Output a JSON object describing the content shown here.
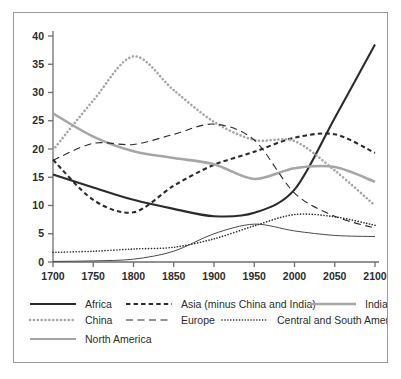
{
  "chart_data": {
    "type": "line",
    "title": "",
    "subtitle": "",
    "xlabel": "",
    "ylabel": "",
    "xlim": [
      1700,
      2100
    ],
    "ylim": [
      0,
      40
    ],
    "xticks": [
      1700,
      1750,
      1800,
      1850,
      1900,
      1950,
      2000,
      2050,
      2100
    ],
    "yticks": [
      0,
      5,
      10,
      15,
      20,
      25,
      30,
      35,
      40
    ],
    "grid": false,
    "legend_position": "bottom",
    "x": [
      1700,
      1750,
      1800,
      1850,
      1900,
      1950,
      2000,
      2050,
      2100
    ],
    "series": [
      {
        "name": "Africa",
        "style": "solid",
        "color": "#2b2b2b",
        "width": 2.1,
        "values": [
          15.5,
          13.2,
          11.0,
          9.4,
          8.1,
          8.7,
          12.8,
          25.5,
          38.5
        ]
      },
      {
        "name": "Asia (minus China and India)",
        "style": "dashed-thick",
        "color": "#2b2b2b",
        "width": 2.1,
        "values": [
          18.1,
          11.0,
          8.8,
          13.5,
          17.2,
          19.5,
          22.0,
          22.6,
          19.3
        ]
      },
      {
        "name": "India",
        "style": "solid",
        "color": "#a6a6a6",
        "width": 2.6,
        "values": [
          26.3,
          22.2,
          19.6,
          18.4,
          17.3,
          14.7,
          16.6,
          16.8,
          14.2
        ]
      },
      {
        "name": "China",
        "style": "dotted-thick",
        "color": "#a6a6a6",
        "width": 2.6,
        "values": [
          19.8,
          28.6,
          36.4,
          30.4,
          24.8,
          21.6,
          21.4,
          16.2,
          10.0
        ]
      },
      {
        "name": "Europe",
        "style": "dashed-thin",
        "color": "#2b2b2b",
        "width": 1.1,
        "values": [
          18.0,
          21.0,
          20.8,
          22.6,
          24.4,
          21.6,
          12.2,
          8.1,
          6.0
        ]
      },
      {
        "name": "Central and South America",
        "style": "dotted-thin",
        "color": "#2b2b2b",
        "width": 1.6,
        "values": [
          1.7,
          1.9,
          2.3,
          2.6,
          4.1,
          6.4,
          8.4,
          8.0,
          6.5
        ]
      },
      {
        "name": "North America",
        "style": "solid",
        "color": "#4a4a4a",
        "width": 1.0,
        "values": [
          0.1,
          0.2,
          0.5,
          1.9,
          5.0,
          6.7,
          5.5,
          4.7,
          4.5
        ]
      }
    ]
  },
  "legend": {
    "rows": [
      [
        {
          "label": "Africa",
          "key": "Africa"
        },
        {
          "label": "Asia (minus China and India)",
          "key": "Asia (minus China and India)"
        },
        {
          "label": "India",
          "key": "India"
        }
      ],
      [
        {
          "label": "China",
          "key": "China"
        },
        {
          "label": "Europe",
          "key": "Europe"
        },
        {
          "label": "Central and South America",
          "key": "Central and South America"
        }
      ],
      [
        {
          "label": "North America",
          "key": "North America"
        }
      ]
    ]
  },
  "colors": {
    "frame": "#9a9a9a",
    "axis": "#6e6e6e",
    "text": "#2b2b2b",
    "background": "#ffffff",
    "dark_series": "#2b2b2b",
    "light_series": "#a6a6a6"
  }
}
